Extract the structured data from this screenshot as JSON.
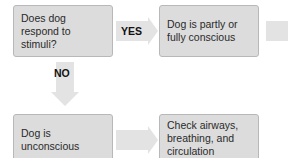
{
  "diagram": {
    "type": "flowchart",
    "colors": {
      "box_fill": "#dcdcdc",
      "box_border": "#b8b8b8",
      "arrow_fill": "#e3e3e3",
      "text": "#2a2a2a"
    },
    "nodes": [
      {
        "id": "q1",
        "text": "Does dog respond to stimuli?"
      },
      {
        "id": "conscious",
        "text": "Dog is partly or fully conscious"
      },
      {
        "id": "unconscious",
        "text": "Dog is unconscious"
      },
      {
        "id": "abc",
        "text": "Check airways, breathing, and circulation (ABCs)"
      }
    ],
    "edges": [
      {
        "from": "q1",
        "to": "conscious",
        "label": "YES"
      },
      {
        "from": "q1",
        "to": "unconscious",
        "label": "NO"
      },
      {
        "from": "unconscious",
        "to": "abc",
        "label": ""
      },
      {
        "from": "conscious",
        "to": "offscreen",
        "label": ""
      }
    ]
  }
}
